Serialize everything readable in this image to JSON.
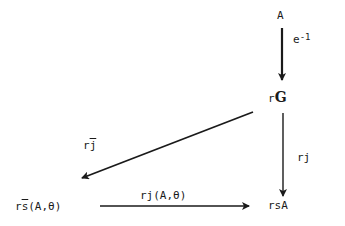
{
  "diagram": {
    "type": "commutative-diagram",
    "nodes": {
      "A": {
        "text": "A"
      },
      "rG": {
        "prefix": "r",
        "symbol": "G"
      },
      "rsA": {
        "text": "rsA"
      },
      "rsbar": {
        "prefix": "r",
        "bar_char": "s",
        "suffix": "(A,θ)"
      }
    },
    "arrows": {
      "e_inv": {
        "base": "e",
        "exp": "-1",
        "from": "A",
        "to": "rG"
      },
      "rj": {
        "text": "rj",
        "from": "rG",
        "to": "rsA"
      },
      "rjbar": {
        "prefix": "r",
        "bar_char": "j",
        "from": "rG",
        "to": "rsbar"
      },
      "rjAtheta": {
        "text": "rj(A,θ)",
        "from": "rsbar",
        "to": "rsA"
      }
    }
  }
}
